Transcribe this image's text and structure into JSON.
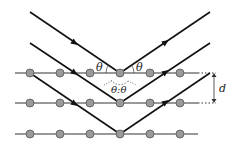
{
  "diagram": {
    "labels": {
      "theta_incident": "θ",
      "theta_reflected": "θ",
      "theta_pair": "θ:θ",
      "spacing": "d"
    },
    "planes": [
      {
        "y": 73,
        "x_start": 15,
        "x_end": 198
      },
      {
        "y": 103,
        "x_start": 15,
        "x_end": 198
      },
      {
        "y": 134,
        "x_start": 15,
        "x_end": 198
      }
    ],
    "atoms_x": [
      30,
      60,
      90,
      120,
      150,
      180
    ],
    "rays": [
      {
        "in_start": [
          30,
          12
        ],
        "apex": [
          120,
          73
        ],
        "out_end": [
          210,
          12
        ]
      },
      {
        "in_start": [
          30,
          43
        ],
        "apex": [
          120,
          103
        ],
        "out_end": [
          210,
          43
        ]
      },
      {
        "in_start": [
          30,
          73
        ],
        "apex": [
          120,
          134
        ],
        "out_end": [
          210,
          73
        ]
      }
    ],
    "colors": {
      "ray": "#111111",
      "plane": "#333333",
      "atom_fill": "#9a9a9a",
      "atom_stroke": "#555555"
    }
  }
}
